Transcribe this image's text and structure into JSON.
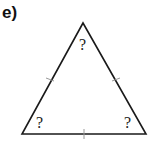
{
  "label": "e)",
  "triangle": {
    "vertices": {
      "apex": [
        83,
        23
      ],
      "bottom_left": [
        22,
        134
      ],
      "bottom_right": [
        146,
        134
      ]
    },
    "stroke_color": "#1a1a1a",
    "tick_color": "#999999",
    "angle_labels": {
      "top": "?",
      "bottom_left": "?",
      "bottom_right": "?"
    }
  }
}
